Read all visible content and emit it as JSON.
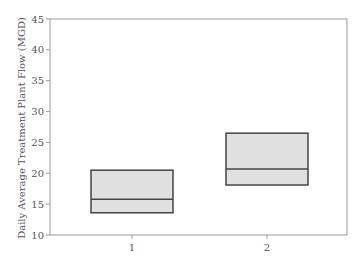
{
  "chart_data": {
    "type": "box",
    "title": "",
    "xlabel": "",
    "ylabel": "Daily Average Treatment Plant Flow (MGD)",
    "categories": [
      "1",
      "2"
    ],
    "ylim": [
      10,
      45
    ],
    "yticks": [
      10,
      15,
      20,
      25,
      30,
      35,
      40,
      45
    ],
    "grid": false,
    "legend": null,
    "boxes": [
      {
        "category": "1",
        "q1": 13.6,
        "median": 15.8,
        "q3": 20.5
      },
      {
        "category": "2",
        "q1": 18.1,
        "median": 20.7,
        "q3": 26.5
      }
    ],
    "colors": {
      "box_fill": "#e0e0e0",
      "box_edge": "#444444",
      "axis": "#999999",
      "text": "#555555"
    }
  }
}
